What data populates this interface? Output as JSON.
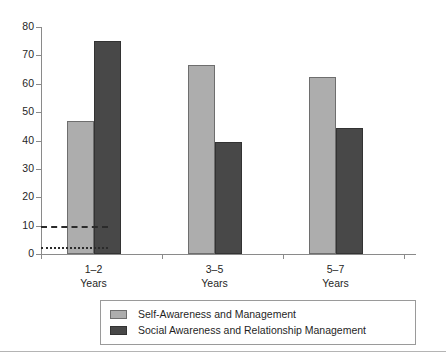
{
  "chart_data": {
    "type": "bar",
    "title": "",
    "subtitle": "",
    "xlabel": "",
    "ylabel": "",
    "categories": [
      "1–2\nYears",
      "3–5\nYears",
      "5–7\nYears"
    ],
    "category_lines": [
      {
        "line1": "1–2",
        "line2": "Years"
      },
      {
        "line1": "3–5",
        "line2": "Years"
      },
      {
        "line1": "5–7",
        "line2": "Years"
      }
    ],
    "series": [
      {
        "name": "Self-Awareness and Management",
        "color": "#adadad",
        "values": [
          47,
          66.5,
          62.5
        ]
      },
      {
        "name": "Social Awareness and Relationship Management",
        "color": "#484848",
        "values": [
          75,
          39.5,
          44.5
        ]
      }
    ],
    "ylim": [
      0,
      80
    ],
    "yticks": [
      0,
      10,
      20,
      30,
      40,
      50,
      60,
      70,
      80
    ],
    "ytick_labels": [
      "0",
      "10",
      "20",
      "30",
      "40",
      "50",
      "60",
      "70",
      "80"
    ],
    "grid": false,
    "legend_position": "bottom",
    "annotations": [
      {
        "name": "reference-line-dashed",
        "type": "horizontal-line",
        "style": "dashed",
        "value": 10,
        "x_extent_fraction": 0.185
      },
      {
        "name": "reference-line-dotted",
        "type": "horizontal-line",
        "style": "dotted",
        "value": 2.5,
        "x_extent_fraction": 0.185
      }
    ]
  },
  "legend": {
    "items": [
      {
        "label": "Self-Awareness and Management",
        "color": "#adadad"
      },
      {
        "label": "Social Awareness and Relationship Management",
        "color": "#484848"
      }
    ]
  },
  "colors": {
    "series_light": "#adadad",
    "series_dark": "#484848",
    "axis": "#8a8a8a",
    "text": "#1f1f1f",
    "rule": "#b4b4b4"
  }
}
